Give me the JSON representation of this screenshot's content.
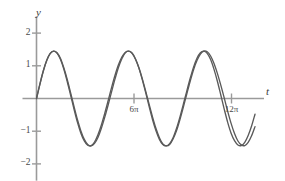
{
  "figure": {
    "axis_label_y": "y",
    "axis_label_x": "t",
    "curve_color": "#5a5a5a",
    "axis_color": "#9a9a9a",
    "background": "#ffffff"
  },
  "chart_data": {
    "type": "line",
    "title": "",
    "xlabel": "t",
    "ylabel": "y",
    "grid": false,
    "legend": "none",
    "xlim": [
      0,
      14.08
    ],
    "ylim": [
      -2.45,
      2.45
    ],
    "y_ticks": [
      2,
      1,
      -1,
      -2
    ],
    "y_tick_labels": [
      "2",
      "1",
      "−1",
      "−2"
    ],
    "x_ticks": [
      6.283185,
      12.566371
    ],
    "x_tick_labels": [
      "6π",
      "12π"
    ],
    "x_tick_units": "pi",
    "series": [
      {
        "name": "curve-1",
        "expression": "sin(t) + sin(1.08t)",
        "amplitude_max": 1.45,
        "amplitude_min": -1.45,
        "x": [
          0.0,
          0.22,
          0.44,
          0.66,
          0.88,
          1.1,
          1.32,
          1.54,
          1.76,
          1.98,
          2.2,
          2.42,
          2.64,
          2.86,
          3.08,
          3.3,
          3.52,
          3.74,
          3.96,
          4.18,
          4.4,
          4.62,
          4.84,
          5.06,
          5.28,
          5.5,
          5.72,
          5.94,
          6.16,
          6.38,
          6.6,
          6.82,
          7.04,
          7.26,
          7.48,
          7.7,
          7.92,
          8.14,
          8.36,
          8.58,
          8.8,
          9.02,
          9.24,
          9.46,
          9.68,
          9.9,
          10.12,
          10.34,
          10.56,
          10.78,
          11.0,
          11.22,
          11.44,
          11.66,
          11.88,
          12.1,
          12.32,
          12.54,
          12.76,
          12.98,
          13.2,
          13.42,
          13.64,
          13.86,
          14.08
        ],
        "y": [
          0.0,
          0.44,
          0.85,
          1.17,
          1.38,
          1.45,
          1.39,
          1.2,
          0.9,
          0.52,
          0.1,
          -0.33,
          -0.73,
          -1.06,
          -1.3,
          -1.43,
          -1.44,
          -1.33,
          -1.11,
          -0.81,
          -0.45,
          -0.06,
          0.34,
          0.71,
          1.03,
          1.27,
          1.41,
          1.45,
          1.38,
          1.2,
          0.94,
          0.6,
          0.22,
          -0.18,
          -0.57,
          -0.92,
          -1.2,
          -1.39,
          -1.45,
          -1.41,
          -1.24,
          -0.99,
          -0.65,
          -0.27,
          0.13,
          0.52,
          0.88,
          1.16,
          1.36,
          1.45,
          1.43,
          1.3,
          1.07,
          0.76,
          0.4,
          0.01,
          -0.39,
          -0.76,
          -1.07,
          -1.3,
          -1.42,
          -1.44,
          -1.34,
          -1.14,
          -0.86
        ]
      },
      {
        "name": "curve-2",
        "expression": "sin(t) + sin(0.92t)",
        "amplitude_max": 1.45,
        "amplitude_min": -1.45,
        "x": [
          0.0,
          0.22,
          0.44,
          0.66,
          0.88,
          1.1,
          1.32,
          1.54,
          1.76,
          1.98,
          2.2,
          2.42,
          2.64,
          2.86,
          3.08,
          3.3,
          3.52,
          3.74,
          3.96,
          4.18,
          4.4,
          4.62,
          4.84,
          5.06,
          5.28,
          5.5,
          5.72,
          5.94,
          6.16,
          6.38,
          6.6,
          6.82,
          7.04,
          7.26,
          7.48,
          7.7,
          7.92,
          8.14,
          8.36,
          8.58,
          8.8,
          9.02,
          9.24,
          9.46,
          9.68,
          9.9,
          10.12,
          10.34,
          10.56,
          10.78,
          11.0,
          11.22,
          11.44,
          11.66,
          11.88,
          12.1,
          12.32,
          12.54,
          12.76,
          12.98,
          13.2,
          13.42,
          13.64,
          13.86,
          14.08
        ],
        "y": [
          0.0,
          0.44,
          0.84,
          1.16,
          1.37,
          1.45,
          1.4,
          1.23,
          0.94,
          0.58,
          0.17,
          -0.25,
          -0.65,
          -0.99,
          -1.25,
          -1.41,
          -1.45,
          -1.37,
          -1.19,
          -0.91,
          -0.57,
          -0.19,
          0.21,
          0.6,
          0.95,
          1.22,
          1.4,
          1.45,
          1.39,
          1.21,
          0.93,
          0.57,
          0.17,
          -0.25,
          -0.65,
          -0.99,
          -1.25,
          -1.41,
          -1.45,
          -1.38,
          -1.2,
          -0.92,
          -0.57,
          -0.18,
          0.22,
          0.61,
          0.96,
          1.23,
          1.4,
          1.45,
          1.38,
          1.19,
          0.89,
          0.52,
          0.1,
          -0.33,
          -0.73,
          -1.06,
          -1.29,
          -1.42,
          -1.44,
          -1.34,
          -1.13,
          -0.84,
          -0.48
        ]
      }
    ]
  }
}
